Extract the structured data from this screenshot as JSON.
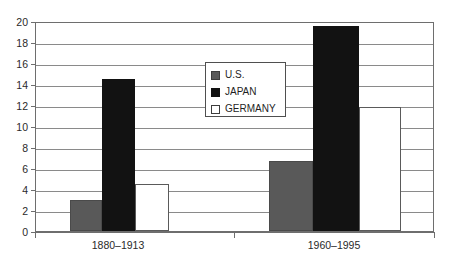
{
  "chart_data": {
    "type": "bar",
    "title": "",
    "subtitle": "",
    "xlabel": "",
    "ylabel": "",
    "categories": [
      "1880–1913",
      "1960–1995"
    ],
    "series": [
      {
        "name": "U.S.",
        "color": "#595959",
        "values": [
          3.0,
          6.7
        ]
      },
      {
        "name": "JAPAN",
        "color": "#121212",
        "values": [
          14.5,
          19.5
        ]
      },
      {
        "name": "GERMANY",
        "color": "#ffffff",
        "values": [
          4.5,
          11.8
        ]
      }
    ],
    "ylim": [
      0,
      20
    ],
    "ytick_step": 2,
    "yticks": [
      0,
      2,
      4,
      6,
      8,
      10,
      12,
      14,
      16,
      18,
      20
    ],
    "ytick_labels": [
      "0",
      "2",
      "4",
      "6",
      "8",
      "10",
      "12",
      "14",
      "16",
      "18",
      "20"
    ],
    "grid": "horizontal",
    "legend_position": "center",
    "legend_entries": [
      "U.S.",
      "JAPAN",
      "GERMANY"
    ],
    "annotations": []
  },
  "colors": {
    "axis": "#6e6e6e",
    "gridline": "#8a8a8a",
    "text": "#2a2a2a",
    "background": "#ffffff",
    "series_us": "#595959",
    "series_japan": "#121212",
    "series_germany": "#ffffff"
  }
}
